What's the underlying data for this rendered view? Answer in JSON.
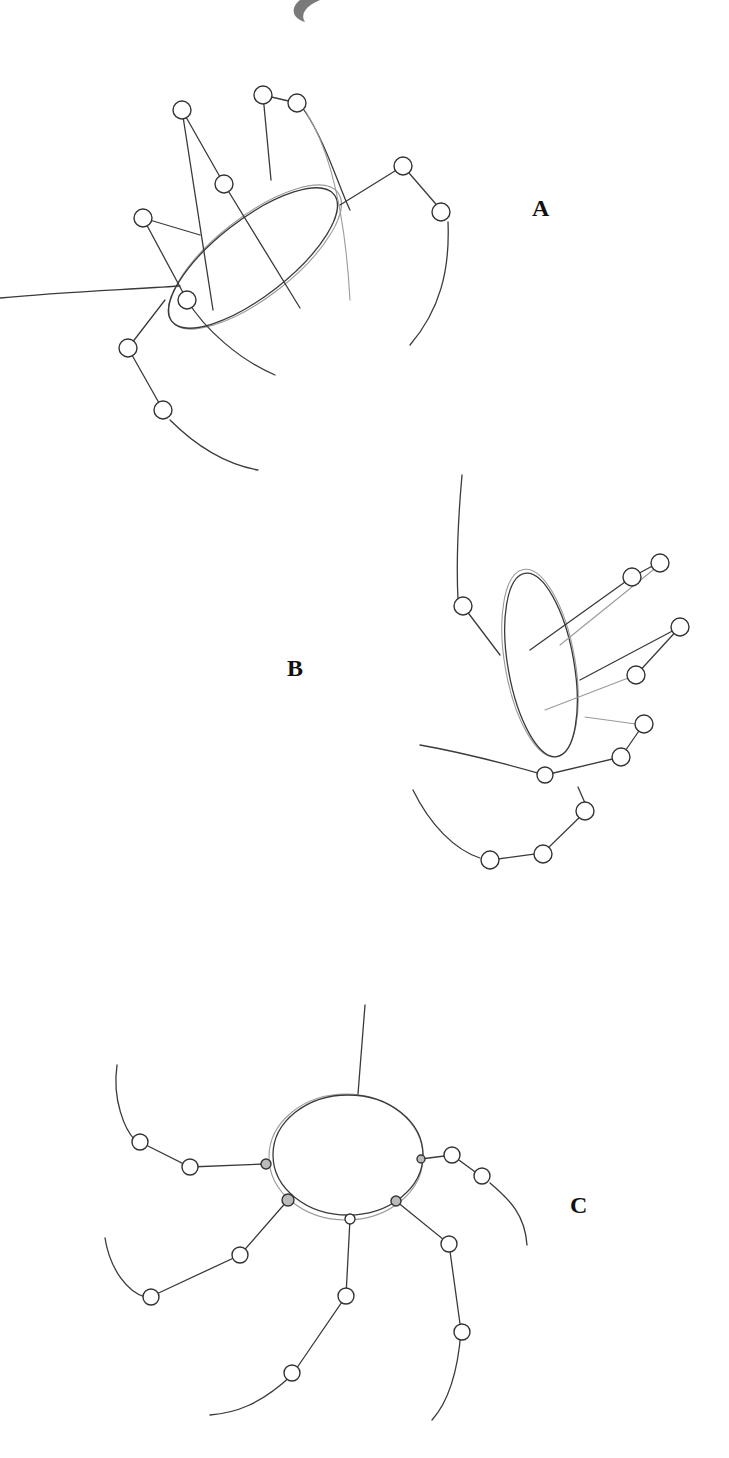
{
  "figures": [
    {
      "id": "A",
      "label": "A",
      "description": "Tilted elliptical body with eight jointed legs radiating outward"
    },
    {
      "id": "B",
      "label": "B",
      "description": "Body viewed edge-on as vertical ellipse with legs extending right and curving below"
    },
    {
      "id": "C",
      "label": "C",
      "description": "Round body with hanging thread above and legs radiating outward and downward"
    }
  ],
  "decoration": {
    "top_swoosh": "swoosh-mark"
  },
  "colors": {
    "background": "#ffffff",
    "pencil": "#3a3a3a",
    "light_pencil": "#9a9a9a"
  }
}
